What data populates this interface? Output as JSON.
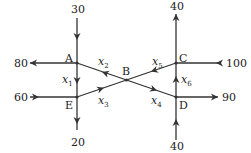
{
  "diagram": {
    "type": "traffic-flow-network",
    "nodes": [
      {
        "id": "A",
        "label": "A"
      },
      {
        "id": "B",
        "label": "B"
      },
      {
        "id": "C",
        "label": "C"
      },
      {
        "id": "D",
        "label": "D"
      },
      {
        "id": "E",
        "label": "E"
      }
    ],
    "external_flows": {
      "A_in_top": "30",
      "A_out_left": "80",
      "E_in_left": "60",
      "E_out_bottom": "20",
      "C_out_top": "40",
      "C_in_right": "100",
      "D_out_right": "90",
      "D_in_bottom": "40"
    },
    "variables": {
      "x1": {
        "name": "x",
        "sub": "1",
        "from": "A",
        "to": "E"
      },
      "x2": {
        "name": "x",
        "sub": "2",
        "from": "B",
        "to": "A"
      },
      "x3": {
        "name": "x",
        "sub": "3",
        "from": "E",
        "to": "B"
      },
      "x4": {
        "name": "x",
        "sub": "4",
        "from": "B",
        "to": "D"
      },
      "x5": {
        "name": "x",
        "sub": "5",
        "from": "C",
        "to": "B"
      },
      "x6": {
        "name": "x",
        "sub": "6",
        "from": "D",
        "to": "C"
      }
    },
    "line_color": "#333333"
  }
}
